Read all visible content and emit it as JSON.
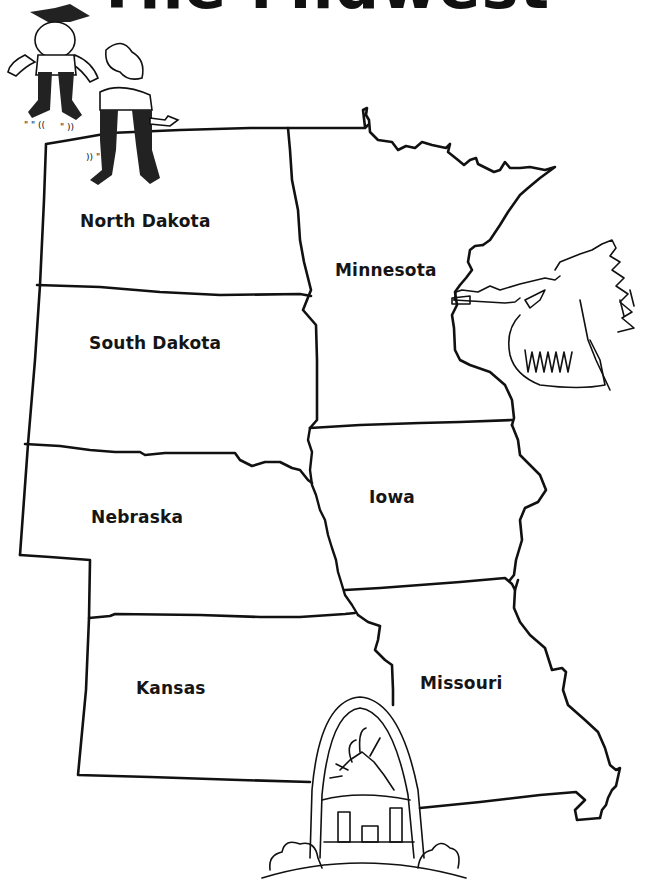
{
  "title": "The Midwest",
  "map": {
    "region": "Midwest United States",
    "stroke_color": "#111111",
    "background_color": "#ffffff",
    "states": [
      {
        "name": "North Dakota",
        "label_x": 80,
        "label_y": 211
      },
      {
        "name": "Minnesota",
        "label_x": 335,
        "label_y": 260
      },
      {
        "name": "South Dakota",
        "label_x": 89,
        "label_y": 333
      },
      {
        "name": "Nebraska",
        "label_x": 91,
        "label_y": 507
      },
      {
        "name": "Iowa",
        "label_x": 369,
        "label_y": 487
      },
      {
        "name": "Kansas",
        "label_x": 136,
        "label_y": 678
      },
      {
        "name": "Missouri",
        "label_x": 420,
        "label_y": 673
      }
    ]
  },
  "illustrations": [
    {
      "name": "dancing-cowboys",
      "description": "Two dancing cowboys"
    },
    {
      "name": "native-chief-peace-pipe",
      "description": "Native American chief smoking a peace pipe"
    },
    {
      "name": "gateway-arch",
      "description": "St. Louis Gateway Arch with city skyline and sun"
    }
  ]
}
